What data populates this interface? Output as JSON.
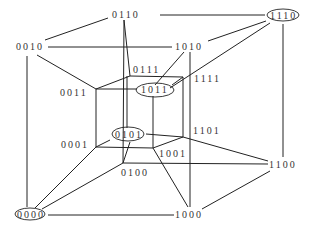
{
  "diagram": {
    "type": "4D hypercube (tesseract) with binary-labeled vertices",
    "nodes": [
      {
        "id": "0110",
        "label": "0110",
        "x": 138,
        "y": 18,
        "highlighted": false
      },
      {
        "id": "1110",
        "label": "1110",
        "x": 282,
        "y": 18,
        "highlighted": true
      },
      {
        "id": "0010",
        "label": "0010",
        "x": 30,
        "y": 50,
        "highlighted": false
      },
      {
        "id": "1010",
        "label": "1010",
        "x": 182,
        "y": 50,
        "highlighted": false
      },
      {
        "id": "0111",
        "label": "0111",
        "x": 148,
        "y": 73,
        "highlighted": false
      },
      {
        "id": "1111",
        "label": "1111",
        "x": 207,
        "y": 82,
        "highlighted": false
      },
      {
        "id": "0011",
        "label": "0011",
        "x": 72,
        "y": 96,
        "highlighted": false
      },
      {
        "id": "1011",
        "label": "1011",
        "x": 156,
        "y": 93,
        "highlighted": true
      },
      {
        "id": "0101",
        "label": "0101",
        "x": 128,
        "y": 138,
        "highlighted": true
      },
      {
        "id": "1101",
        "label": "1101",
        "x": 210,
        "y": 133,
        "highlighted": false
      },
      {
        "id": "0001",
        "label": "0001",
        "x": 73,
        "y": 148,
        "highlighted": false
      },
      {
        "id": "1001",
        "label": "1001",
        "x": 174,
        "y": 157,
        "highlighted": false
      },
      {
        "id": "0100",
        "label": "0100",
        "x": 131,
        "y": 176,
        "highlighted": false
      },
      {
        "id": "1100",
        "label": "1100",
        "x": 284,
        "y": 167,
        "highlighted": false
      },
      {
        "id": "0000",
        "label": "0000",
        "x": 30,
        "y": 217,
        "highlighted": true
      },
      {
        "id": "1000",
        "label": "1000",
        "x": 188,
        "y": 217,
        "highlighted": false
      }
    ]
  }
}
